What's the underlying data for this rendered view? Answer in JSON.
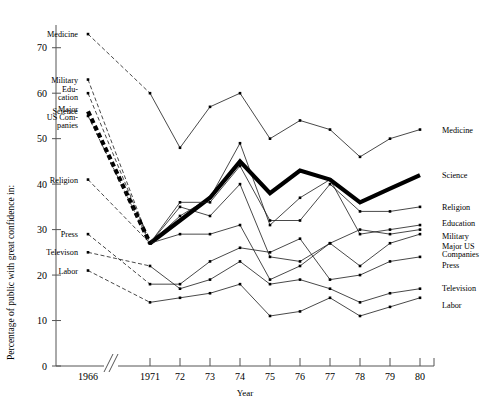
{
  "chart_data": {
    "type": "line",
    "title": "",
    "xlabel": "Year",
    "ylabel": "Percentage of public with great confidence in:",
    "ylim": [
      0,
      75
    ],
    "yticks": [
      0,
      10,
      20,
      30,
      40,
      50,
      60,
      70
    ],
    "grid": false,
    "axis_break": true,
    "axis_break_note": "break between 1966 and 1971",
    "legend": "inline-labels-both-sides",
    "categories": [
      "1966",
      "1971",
      "72",
      "73",
      "74",
      "75",
      "76",
      "77",
      "78",
      "79",
      "80"
    ],
    "x": [
      1966,
      1971,
      1972,
      1973,
      1974,
      1975,
      1976,
      1977,
      1978,
      1979,
      1980
    ],
    "series": [
      {
        "name": "Medicine",
        "left_label": "Medicine",
        "right_label": "Medicine",
        "style": "thin",
        "values": [
          73,
          60,
          48,
          57,
          60,
          50,
          54,
          52,
          46,
          50,
          52
        ]
      },
      {
        "name": "Military",
        "left_label": "Military",
        "right_label": "Military",
        "style": "thin",
        "values": [
          63,
          27,
          35,
          33,
          40,
          24,
          23,
          27,
          30,
          29,
          30
        ]
      },
      {
        "name": "Education",
        "left_label": "Edu-\ncation",
        "right_label": "Education",
        "style": "thin",
        "values": [
          60,
          27,
          33,
          37,
          49,
          31,
          37,
          41,
          29,
          30,
          31
        ]
      },
      {
        "name": "Science",
        "left_label": "Science",
        "right_label": "Science",
        "style": "thick",
        "values": [
          56,
          27,
          32,
          37,
          45,
          38,
          43,
          41,
          36,
          39,
          42
        ]
      },
      {
        "name": "Major US Companies",
        "left_label": "Major\nUS Com-\npanies",
        "right_label": "Major US\nCompanies",
        "style": "thin",
        "values": [
          55,
          27,
          29,
          29,
          31,
          19,
          22,
          27,
          22,
          27,
          29
        ]
      },
      {
        "name": "Religion",
        "left_label": "Religion",
        "right_label": "Religion",
        "style": "thin",
        "values": [
          41,
          27,
          36,
          36,
          44,
          32,
          32,
          40,
          34,
          34,
          35
        ]
      },
      {
        "name": "Press",
        "left_label": "Press",
        "right_label": "Press",
        "style": "thin",
        "values": [
          29,
          18,
          18,
          23,
          26,
          25,
          28,
          19,
          20,
          23,
          24
        ]
      },
      {
        "name": "Television",
        "left_label": "Televison",
        "right_label": "Television",
        "style": "thin",
        "values": [
          25,
          22,
          17,
          19,
          23,
          18,
          19,
          17,
          14,
          16,
          17
        ]
      },
      {
        "name": "Labor",
        "left_label": "Labor",
        "right_label": "Labor",
        "style": "thin",
        "values": [
          21,
          14,
          15,
          16,
          18,
          11,
          12,
          15,
          11,
          13,
          15
        ]
      }
    ]
  },
  "axis": {
    "y_title": "Percentage of public with great confidence in:",
    "x_title": "Year",
    "y_ticks": [
      "70",
      "60",
      "50",
      "40",
      "30",
      "20",
      "10",
      "0"
    ],
    "x_ticks": [
      "1966",
      "1971",
      "72",
      "73",
      "74",
      "75",
      "76",
      "77",
      "78",
      "79",
      "80"
    ]
  },
  "left_labels": [
    {
      "text": "Medicine",
      "key": "medicine"
    },
    {
      "text": "Military",
      "key": "military"
    },
    {
      "text": "Edu-",
      "key": "education-1"
    },
    {
      "text": "cation",
      "key": "education-2"
    },
    {
      "text": "Science",
      "key": "science"
    },
    {
      "text": "Major",
      "key": "majorus-1"
    },
    {
      "text": "US Com-",
      "key": "majorus-2"
    },
    {
      "text": "panies",
      "key": "majorus-3"
    },
    {
      "text": "Religion",
      "key": "religion"
    },
    {
      "text": "Press",
      "key": "press"
    },
    {
      "text": "Televison",
      "key": "television"
    },
    {
      "text": "Labor",
      "key": "labor"
    }
  ],
  "right_labels": [
    {
      "text": "Medicine",
      "key": "medicine"
    },
    {
      "text": "Science",
      "key": "science"
    },
    {
      "text": "Religion",
      "key": "religion"
    },
    {
      "text": "Education",
      "key": "education"
    },
    {
      "text": "Military",
      "key": "military"
    },
    {
      "text": "Major US",
      "key": "majorus-1"
    },
    {
      "text": "Companies",
      "key": "majorus-2"
    },
    {
      "text": "Press",
      "key": "press"
    },
    {
      "text": "Television",
      "key": "television"
    },
    {
      "text": "Labor",
      "key": "labor"
    }
  ],
  "colors": {
    "line": "#1a1a1a",
    "axis": "#555555",
    "background": "#ffffff",
    "highlight": "#000000"
  }
}
